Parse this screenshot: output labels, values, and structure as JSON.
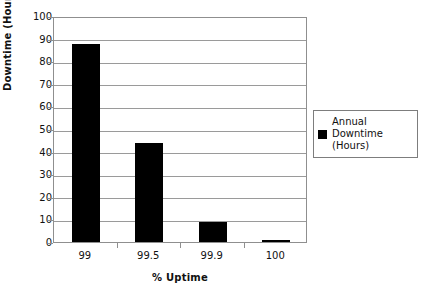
{
  "chart_data": {
    "type": "bar",
    "title": "",
    "xlabel": "% Uptime",
    "ylabel": "Downtime (Hours)",
    "categories": [
      "99",
      "99.5",
      "99.9",
      "100"
    ],
    "values": [
      87.6,
      43.8,
      8.8,
      0.9
    ],
    "series": [
      {
        "name": "Annual Downtime (Hours)",
        "values": [
          87.6,
          43.8,
          8.8,
          0.9
        ]
      }
    ],
    "ylim": [
      0,
      100
    ],
    "ytick_step": 10,
    "yticks": [
      "0",
      "10",
      "20",
      "30",
      "40",
      "50",
      "60",
      "70",
      "80",
      "90",
      "100"
    ],
    "grid": "horizontal",
    "legend_position": "right",
    "bar_color": "#000000",
    "gridline_color": "#9a9a9a",
    "axis_color": "#8f8f8f"
  },
  "legend": {
    "entries": [
      {
        "label": "Annual Downtime\n(Hours)",
        "swatch_name": "legend-swatch-annual-downtime",
        "color": "#000000"
      }
    ]
  }
}
